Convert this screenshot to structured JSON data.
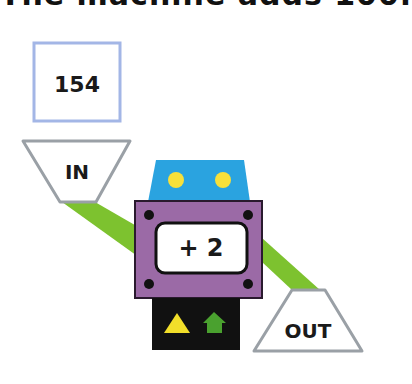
{
  "caption": "The machine adds 100.",
  "input_box": {
    "value": "154",
    "border_color": "#a3b6e6"
  },
  "input_funnel": {
    "label": "IN",
    "stroke": "#9aa0a6"
  },
  "output_funnel": {
    "label": "OUT",
    "stroke": "#9aa0a6"
  },
  "machine": {
    "operation": "+ 2",
    "head_color": "#2aa3e0",
    "eye_color": "#f7e03a",
    "body_color": "#9b6aa6",
    "base_color": "#111111",
    "buttons": [
      {
        "name": "yellow-triangle",
        "color": "#f2df2a"
      },
      {
        "name": "green-arrow-up",
        "color": "#4aa12f"
      }
    ]
  },
  "belt_color": "#7dc22f"
}
